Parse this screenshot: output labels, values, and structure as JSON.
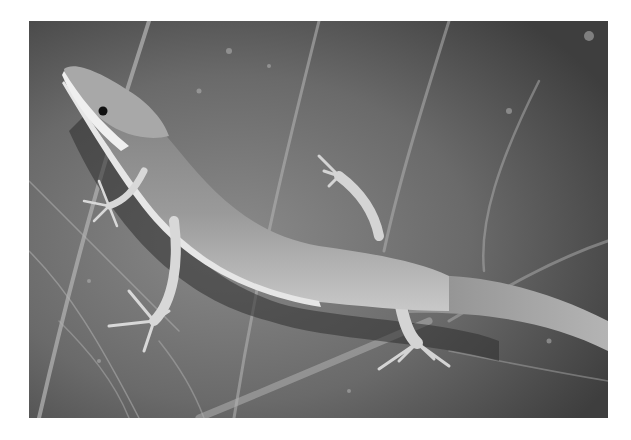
{
  "image": {
    "alt": "Grayscale photograph of a slender lizard (skink) on a large leaf",
    "subject": "lizard",
    "background": "leaf with veins",
    "palette": {
      "border": "#ffffff",
      "leaf_dark": "#4a4a4a",
      "leaf_mid": "#727272",
      "leaf_light": "#9a9a9a",
      "vein": "#b8b8b8",
      "lizard_body": "#8c8c8c",
      "lizard_belly": "#e4e4e4",
      "lizard_limb": "#d0d0d0",
      "eye": "#111111"
    }
  }
}
